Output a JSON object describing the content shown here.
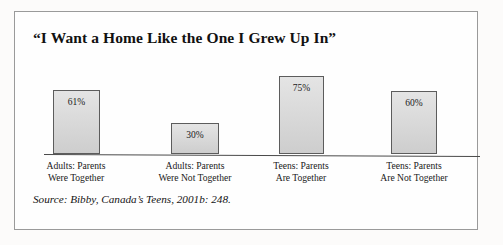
{
  "figure": {
    "title": "“I Want a Home Like the One I Grew Up In”",
    "source": "Source: Bibby, Canada’s Teens, 2001b: 248.",
    "bar_fill": "#d6d6d6",
    "bar_border": "#5c5c5c",
    "axis_color": "#4a4a4a",
    "frame_color": "#9a9a9a"
  },
  "chart_data": {
    "type": "bar",
    "title": "“I Want a Home Like the One I Grew Up In”",
    "xlabel": "",
    "ylabel": "",
    "ylim": [
      0,
      100
    ],
    "grid": false,
    "legend": false,
    "categories": [
      "Adults: Parents Were Together",
      "Adults: Parents Were Not Together",
      "Teens: Parents Are Together",
      "Teens: Parents Are Not Together"
    ],
    "values": [
      61,
      30,
      75,
      60
    ],
    "data_labels": [
      "61%",
      "30%",
      "75%",
      "60%"
    ],
    "bars": [
      {
        "label_line1": "Adults: Parents",
        "label_line2": "Were Together",
        "value": 61,
        "data_label": "61%"
      },
      {
        "label_line1": "Adults: Parents",
        "label_line2": "Were Not Together",
        "value": 30,
        "data_label": "30%"
      },
      {
        "label_line1": "Teens: Parents",
        "label_line2": "Are Together",
        "value": 75,
        "data_label": "75%"
      },
      {
        "label_line1": "Teens: Parents",
        "label_line2": "Are Not Together",
        "value": 60,
        "data_label": "60%"
      }
    ],
    "annotations": [
      "Source: Bibby, Canada’s Teens, 2001b: 248."
    ]
  }
}
